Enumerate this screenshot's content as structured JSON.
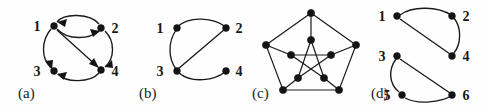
{
  "figure": {
    "width": 489,
    "height": 111,
    "background": "#fefefe",
    "ink_color": "#1a1a1a",
    "panel_count": 4
  },
  "panels": [
    {
      "caption": "(a)",
      "caption_x": 18,
      "caption_y": 88,
      "origin_x": 0,
      "kind": "directed-graph",
      "node_labels": [
        "1",
        "2",
        "3",
        "4"
      ],
      "label_positions": [
        {
          "text": "1",
          "x": 37,
          "y": 30
        },
        {
          "text": "2",
          "x": 110,
          "y": 30
        },
        {
          "text": "3",
          "x": 37,
          "y": 75
        },
        {
          "text": "4",
          "x": 110,
          "y": 75
        }
      ],
      "vertices": [
        {
          "id": "1",
          "x": 54,
          "y": 26
        },
        {
          "id": "2",
          "x": 101,
          "y": 28
        },
        {
          "id": "3",
          "x": 54,
          "y": 71
        },
        {
          "id": "4",
          "x": 101,
          "y": 70
        }
      ],
      "edges": [
        {
          "from": "1",
          "to": "2",
          "style": "arc-upper",
          "directed": true,
          "head_at": "1"
        },
        {
          "from": "1",
          "to": "2",
          "style": "arc-lower",
          "directed": true,
          "head_at": "2"
        },
        {
          "from": "1",
          "to": "3",
          "style": "arc-left",
          "directed": true,
          "head_at": "3"
        },
        {
          "from": "1",
          "to": "4",
          "style": "straight-diagonal",
          "directed": true,
          "head_at": "4"
        },
        {
          "from": "2",
          "to": "4",
          "style": "arc-right",
          "directed": true,
          "head_at": "4"
        },
        {
          "from": "4",
          "to": "3",
          "style": "arc-bottom",
          "directed": true,
          "head_at": "3"
        }
      ]
    },
    {
      "caption": "(b)",
      "caption_x": 139,
      "caption_y": 88,
      "origin_x": 130,
      "kind": "undirected-graph",
      "node_labels": [
        "1",
        "2",
        "3",
        "4"
      ],
      "label_positions": [
        {
          "text": "1",
          "x": 158,
          "y": 32
        },
        {
          "text": "2",
          "x": 236,
          "y": 32
        },
        {
          "text": "3",
          "x": 158,
          "y": 76
        },
        {
          "text": "4",
          "x": 236,
          "y": 76
        }
      ],
      "vertices": [
        {
          "id": "1",
          "x": 177,
          "y": 28
        },
        {
          "id": "2",
          "x": 226,
          "y": 28
        },
        {
          "id": "3",
          "x": 177,
          "y": 71
        },
        {
          "id": "4",
          "x": 226,
          "y": 71
        }
      ],
      "edges": [
        {
          "from": "1",
          "to": "2",
          "style": "arc-top",
          "directed": false
        },
        {
          "from": "1",
          "to": "3",
          "style": "arc-left",
          "directed": false
        },
        {
          "from": "3",
          "to": "2",
          "style": "straight-diagonal",
          "directed": false
        },
        {
          "from": "3",
          "to": "4",
          "style": "arc-bottom",
          "directed": false
        }
      ]
    },
    {
      "caption": "(c)",
      "caption_x": 252,
      "caption_y": 88,
      "origin_x": 245,
      "kind": "petersen-graph",
      "node_labels": [],
      "outer_vertices": [
        {
          "id": "o0",
          "x": 311,
          "y": 13
        },
        {
          "id": "o1",
          "x": 356,
          "y": 45
        },
        {
          "id": "o2",
          "x": 339,
          "y": 90
        },
        {
          "id": "o3",
          "x": 283,
          "y": 90
        },
        {
          "id": "o4",
          "x": 266,
          "y": 45
        }
      ],
      "inner_vertices": [
        {
          "id": "i0",
          "x": 311,
          "y": 40
        },
        {
          "id": "i1",
          "x": 331,
          "y": 55
        },
        {
          "id": "i2",
          "x": 324,
          "y": 78
        },
        {
          "id": "i3",
          "x": 298,
          "y": 78
        },
        {
          "id": "i4",
          "x": 291,
          "y": 55
        }
      ],
      "edges_outer_cycle": [
        [
          "o0",
          "o1"
        ],
        [
          "o1",
          "o2"
        ],
        [
          "o2",
          "o3"
        ],
        [
          "o3",
          "o4"
        ],
        [
          "o4",
          "o0"
        ]
      ],
      "edges_spokes": [
        [
          "o0",
          "i0"
        ],
        [
          "o1",
          "i1"
        ],
        [
          "o2",
          "i2"
        ],
        [
          "o3",
          "i3"
        ],
        [
          "o4",
          "i4"
        ]
      ],
      "edges_inner_pentagram": [
        [
          "i0",
          "i2"
        ],
        [
          "i2",
          "i4"
        ],
        [
          "i4",
          "i1"
        ],
        [
          "i1",
          "i3"
        ],
        [
          "i3",
          "i0"
        ]
      ]
    },
    {
      "caption": "(d)",
      "caption_x": 371,
      "caption_y": 88,
      "origin_x": 365,
      "kind": "undirected-graph-two-components",
      "node_labels": [
        "1",
        "2",
        "3",
        "4",
        "5",
        "6"
      ],
      "label_positions": [
        {
          "text": "1",
          "x": 381,
          "y": 20
        },
        {
          "text": "2",
          "x": 464,
          "y": 20
        },
        {
          "text": "3",
          "x": 381,
          "y": 62
        },
        {
          "text": "4",
          "x": 464,
          "y": 62
        },
        {
          "text": "5",
          "x": 384,
          "y": 99
        },
        {
          "text": "6",
          "x": 464,
          "y": 99
        }
      ],
      "vertices": [
        {
          "id": "1",
          "x": 397,
          "y": 16
        },
        {
          "id": "2",
          "x": 452,
          "y": 16
        },
        {
          "id": "3",
          "x": 397,
          "y": 56
        },
        {
          "id": "4",
          "x": 452,
          "y": 56
        },
        {
          "id": "5",
          "x": 402,
          "y": 95
        },
        {
          "id": "6",
          "x": 452,
          "y": 95
        }
      ],
      "edges": [
        {
          "from": "1",
          "to": "2",
          "style": "arc-top",
          "directed": false
        },
        {
          "from": "2",
          "to": "4",
          "style": "arc-right",
          "directed": false
        },
        {
          "from": "1",
          "to": "4",
          "style": "straight-diagonal",
          "directed": false
        },
        {
          "from": "3",
          "to": "5",
          "style": "arc-left",
          "directed": false
        },
        {
          "from": "5",
          "to": "6",
          "style": "arc-bottom",
          "directed": false
        },
        {
          "from": "3",
          "to": "6",
          "style": "straight-diagonal",
          "directed": false
        }
      ]
    }
  ]
}
